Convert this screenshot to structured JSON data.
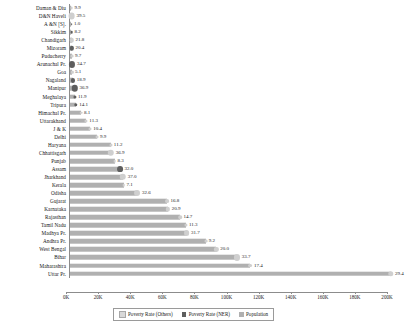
{
  "chart_data": {
    "type": "bar",
    "title": "",
    "xlabel": "",
    "ylabel": "",
    "orientation": "horizontal",
    "xlim": [
      0,
      200000
    ],
    "xticks": [
      "0K",
      "20K",
      "40K",
      "60K",
      "80K",
      "100K",
      "120K",
      "140K",
      "160K",
      "180K",
      "200K"
    ],
    "xtick_values": [
      0,
      20000,
      40000,
      60000,
      80000,
      100000,
      120000,
      140000,
      160000,
      180000,
      200000
    ],
    "grid": false,
    "legend_position": "bottom",
    "legend": [
      "Poverty Rate (Others)",
      "Poverty Rate (NER)",
      "Population"
    ],
    "categories": [
      "Daman & Diu",
      "D&N Haveli",
      "A &N [S].",
      "Sikkim",
      "Chandigarh",
      "Mizoram",
      "Puducherry",
      "Arunachal Pr.",
      "Goa",
      "Nagaland",
      "Manipur",
      "Meghalaya",
      "Tripura",
      "Himachal Pr.",
      "Uttarakhand",
      "J & K",
      "Delhi",
      "Haryana",
      "Chhattisgarh",
      "Punjab",
      "Assam",
      "Jharkhand",
      "Kerala",
      "Odisha",
      "Gujarat",
      "Karnataka",
      "Rajasthan",
      "Tamil Nadu",
      "Madhya Pr.",
      "Andhra Pr.",
      "West Bengal",
      "Bihar",
      "Maharashtra",
      "Uttar Pr."
    ],
    "series": [
      {
        "name": "Population",
        "values": [
          243,
          343,
          381,
          611,
          1055,
          1097,
          1248,
          1384,
          1459,
          1979,
          2856,
          2967,
          3674,
          6865,
          10086,
          12541,
          16788,
          25351,
          25545,
          27743,
          31206,
          32988,
          33406,
          41974,
          60440,
          61095,
          68548,
          72147,
          72627,
          84581,
          91276,
          104099,
          112374,
          199812
        ]
      },
      {
        "name": "Poverty Rate",
        "values": [
          9.9,
          39.5,
          1.0,
          8.2,
          21.8,
          20.4,
          9.7,
          34.7,
          5.1,
          18.9,
          36.9,
          11.9,
          14.1,
          8.1,
          11.3,
          10.4,
          9.9,
          11.2,
          36.9,
          8.3,
          32.0,
          37.0,
          7.1,
          32.6,
          16.8,
          20.9,
          14.7,
          11.3,
          31.7,
          9.2,
          20.0,
          33.7,
          17.4,
          29.4
        ],
        "group": [
          "Others",
          "Others",
          "NER",
          "NER",
          "Others",
          "NER",
          "Others",
          "NER",
          "Others",
          "NER",
          "NER",
          "NER",
          "NER",
          "Others",
          "Others",
          "Others",
          "Others",
          "Others",
          "Others",
          "Others",
          "NER",
          "Others",
          "Others",
          "Others",
          "Others",
          "Others",
          "Others",
          "Others",
          "Others",
          "Others",
          "Others",
          "Others",
          "Others",
          "Others"
        ]
      }
    ]
  },
  "colors": {
    "population_bar": "#b0b0b0",
    "poverty_others": "#cfcfcf",
    "poverty_ner": "#5e5e5e",
    "axis": "#8c8c8c"
  }
}
